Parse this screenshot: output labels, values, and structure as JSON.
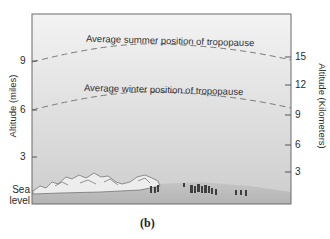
{
  "figure": {
    "caption": "(b)",
    "left_axis": {
      "title": "Altitude (miles)",
      "ticks": [
        "9",
        "6",
        "3"
      ],
      "bottom_label_line1": "Sea",
      "bottom_label_line2": "level"
    },
    "right_axis": {
      "title": "Altitude (Kilometers)",
      "ticks": [
        "15",
        "12",
        "9",
        "6",
        "3"
      ]
    },
    "lines": {
      "summer": "Average summer position of tropopause",
      "winter": "Average winter position of tropopause"
    },
    "colors": {
      "sky_top": "#f2f2f2",
      "sky_bottom": "#cfcfcf",
      "ground": "#b9b9b9",
      "frame": "#6b6b6b",
      "dash": "#7a7a7a"
    }
  }
}
